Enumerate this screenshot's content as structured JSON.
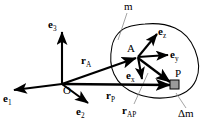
{
  "figure": {
    "background_color": "#ffffff",
    "stroke_color": "#000000",
    "leader_color": "#8c8c8c",
    "element_fill": "#9a9a9a",
    "width": 213,
    "height": 127
  },
  "labels": {
    "body_mass": "m",
    "element_mass_delta": "Δ",
    "element_mass_m": "m",
    "origin": "O",
    "point_a": "A",
    "point_p": "P",
    "e1": "e",
    "e1_sub": "1",
    "e2": "e",
    "e2_sub": "2",
    "e3": "e",
    "e3_sub": "3",
    "ex": "e",
    "ex_sub": "x",
    "ey": "e",
    "ey_sub": "y",
    "ez": "e",
    "ez_sub": "z",
    "r_a": "r",
    "r_a_sub": "A",
    "r_p": "r",
    "r_p_sub": "P",
    "r_ap": "r",
    "r_ap_sub": "AP"
  },
  "geometry": {
    "origin_point": [
      62,
      84
    ],
    "point_a": [
      138,
      57
    ],
    "point_p": [
      174,
      84
    ],
    "element_square": [
      170,
      80,
      9,
      9
    ]
  }
}
